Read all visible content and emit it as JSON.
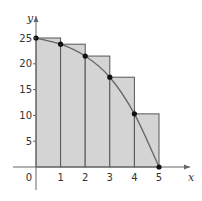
{
  "chart_data": {
    "type": "bar",
    "title": "",
    "xlabel": "x",
    "ylabel": "y",
    "xlim": [
      0,
      5
    ],
    "ylim": [
      0,
      25
    ],
    "x_ticks": [
      "0",
      "1",
      "2",
      "3",
      "4",
      "5"
    ],
    "y_ticks": [
      "5",
      "10",
      "15",
      "20",
      "25"
    ],
    "grid": false,
    "legend": "none",
    "rectangles": {
      "description": "Left-endpoint rectangles of width 1 under a decreasing curve",
      "x_left": [
        0,
        1,
        2,
        3,
        4
      ],
      "heights": [
        25,
        23.8,
        21.5,
        17.4,
        10.3
      ]
    },
    "curve": {
      "type": "line",
      "x": [
        0,
        1,
        2,
        3,
        4,
        5
      ],
      "y": [
        25,
        23.8,
        21.5,
        17.4,
        10.3,
        0
      ]
    },
    "points": [
      {
        "x": 0,
        "y": 25
      },
      {
        "x": 1,
        "y": 23.8
      },
      {
        "x": 2,
        "y": 21.5
      },
      {
        "x": 3,
        "y": 17.4
      },
      {
        "x": 4,
        "y": 10.3
      },
      {
        "x": 5,
        "y": 0
      }
    ],
    "colors": {
      "rect_fill": "#d4d4d4",
      "rect_stroke": "#555555",
      "curve": "#666666",
      "point": "#111111",
      "axis": "#666666"
    }
  }
}
